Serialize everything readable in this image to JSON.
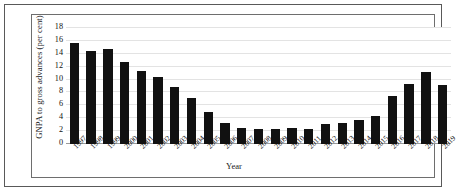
{
  "chart_data": {
    "type": "bar",
    "title": "",
    "xlabel": "Year",
    "ylabel": "GNPA to gross advances (per cent)",
    "ylim": [
      0,
      18
    ],
    "yticks": [
      0,
      2,
      4,
      6,
      8,
      10,
      12,
      14,
      16,
      18
    ],
    "grid": true,
    "legend": "none",
    "bar_color": "#111111",
    "gridline_color": "#e3e3e3",
    "categories": [
      "1997",
      "1998",
      "1999",
      "2000",
      "2001",
      "2002",
      "2003",
      "2004",
      "2005",
      "2006",
      "2007",
      "2008",
      "2009",
      "2010",
      "2011",
      "2012",
      "2013",
      "2014",
      "2015",
      "2016",
      "2017",
      "2018",
      "2019"
    ],
    "values": [
      15.7,
      14.4,
      14.7,
      12.7,
      11.4,
      10.4,
      8.8,
      7.2,
      5.0,
      3.3,
      2.5,
      2.3,
      2.4,
      2.5,
      2.4,
      3.1,
      3.3,
      3.8,
      4.3,
      7.5,
      9.3,
      11.2,
      9.1
    ]
  }
}
